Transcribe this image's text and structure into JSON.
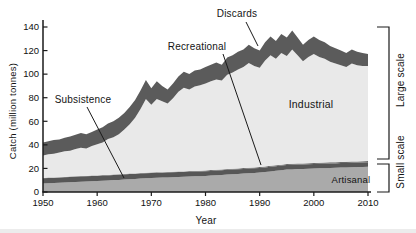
{
  "chart_data": {
    "type": "area",
    "stacked": true,
    "title": "",
    "xlabel": "Year",
    "ylabel": "Catch (million tonnes)",
    "xlim": [
      1950,
      2010
    ],
    "ylim": [
      0,
      140
    ],
    "x_ticks": [
      1950,
      1960,
      1970,
      1980,
      1990,
      2000,
      2010
    ],
    "y_ticks": [
      0,
      20,
      40,
      60,
      80,
      100,
      120,
      140
    ],
    "grid": false,
    "legend_position": "inline-annotations",
    "x": [
      1950,
      1951,
      1952,
      1953,
      1954,
      1955,
      1956,
      1957,
      1958,
      1959,
      1960,
      1961,
      1962,
      1963,
      1964,
      1965,
      1966,
      1967,
      1968,
      1969,
      1970,
      1971,
      1972,
      1973,
      1974,
      1975,
      1976,
      1977,
      1978,
      1979,
      1980,
      1981,
      1982,
      1983,
      1984,
      1985,
      1986,
      1987,
      1988,
      1989,
      1990,
      1991,
      1992,
      1993,
      1994,
      1995,
      1996,
      1997,
      1998,
      1999,
      2000,
      2001,
      2002,
      2003,
      2004,
      2005,
      2006,
      2007,
      2008,
      2009,
      2010
    ],
    "series": [
      {
        "name": "Artisanal",
        "color": "#aaaaaa",
        "values": [
          7.2,
          7.4,
          7.6,
          7.8,
          8.0,
          8.3,
          8.5,
          8.7,
          8.9,
          9.1,
          9.3,
          9.6,
          9.8,
          10.1,
          10.3,
          10.6,
          10.9,
          11.1,
          11.4,
          11.6,
          11.9,
          12.1,
          12.2,
          12.4,
          12.6,
          12.8,
          12.9,
          13.1,
          13.3,
          13.4,
          13.6,
          13.9,
          14.2,
          14.5,
          14.8,
          15.1,
          15.3,
          15.6,
          15.9,
          16.2,
          16.5,
          17.0,
          17.5,
          18.0,
          18.5,
          19.0,
          19.2,
          19.4,
          19.5,
          19.7,
          19.9,
          20.1,
          20.2,
          20.4,
          20.5,
          20.7,
          20.9,
          21.0,
          21.2,
          21.3,
          21.5
        ]
      },
      {
        "name": "Subsistence",
        "color": "#575757",
        "values": [
          4.5,
          4.5,
          4.5,
          4.5,
          4.5,
          4.5,
          4.5,
          4.5,
          4.5,
          4.5,
          4.3,
          4.3,
          4.3,
          4.3,
          4.3,
          4.3,
          4.3,
          4.3,
          4.3,
          4.3,
          4.1,
          4.1,
          4.1,
          4.1,
          4.1,
          4.1,
          4.1,
          4.1,
          4.1,
          4.1,
          4.0,
          4.0,
          4.0,
          4.0,
          4.0,
          4.0,
          4.0,
          4.0,
          4.0,
          4.0,
          3.9,
          3.9,
          3.9,
          3.9,
          3.9,
          3.9,
          3.9,
          3.9,
          3.9,
          3.9,
          3.8,
          3.8,
          3.8,
          3.8,
          3.8,
          3.8,
          3.8,
          3.8,
          3.8,
          3.8,
          3.8
        ]
      },
      {
        "name": "Recreational",
        "color": "#6b6b6b",
        "values": [
          0.3,
          0.3,
          0.3,
          0.3,
          0.3,
          0.3,
          0.3,
          0.3,
          0.3,
          0.3,
          0.4,
          0.4,
          0.4,
          0.4,
          0.4,
          0.4,
          0.4,
          0.4,
          0.4,
          0.4,
          0.5,
          0.5,
          0.5,
          0.5,
          0.5,
          0.5,
          0.5,
          0.5,
          0.5,
          0.5,
          0.7,
          0.7,
          0.7,
          0.7,
          0.7,
          0.7,
          0.7,
          0.7,
          0.7,
          0.7,
          0.8,
          0.8,
          0.8,
          0.8,
          0.8,
          0.8,
          0.8,
          0.8,
          0.8,
          0.8,
          1.0,
          1.0,
          1.0,
          1.0,
          1.0,
          1.0,
          1.0,
          1.0,
          1.0,
          1.0,
          1.0
        ]
      },
      {
        "name": "Industrial",
        "color": "#e9e9e9",
        "values": [
          19.0,
          19.8,
          20.1,
          20.9,
          21.7,
          21.9,
          23.2,
          24.0,
          23.3,
          25.1,
          26.5,
          27.7,
          30.5,
          31.7,
          34.0,
          37.7,
          41.9,
          47.2,
          54.4,
          62.7,
          57.5,
          62.3,
          60.2,
          58.0,
          62.3,
          67.6,
          71.0,
          69.3,
          71.6,
          72.5,
          73.7,
          75.4,
          76.6,
          75.3,
          80.0,
          81.7,
          84.0,
          85.7,
          88.9,
          86.1,
          84.3,
          89.8,
          93.8,
          90.3,
          94.8,
          91.8,
          97.1,
          91.9,
          86.8,
          90.1,
          92.3,
          89.6,
          88.0,
          85.3,
          83.7,
          82.0,
          80.3,
          83.2,
          81.5,
          80.9,
          80.7
        ]
      },
      {
        "name": "Discards",
        "color": "#5b5b5b",
        "values": [
          11,
          11,
          11.5,
          11,
          11.5,
          12,
          12,
          12.5,
          12,
          12,
          12.5,
          13,
          13,
          13.5,
          14,
          14,
          14.5,
          15,
          15.5,
          16,
          14,
          15,
          13,
          12,
          12.5,
          13,
          13.5,
          13,
          13.5,
          13.5,
          14,
          14,
          14.5,
          13.5,
          14.5,
          14.5,
          15,
          15,
          15.5,
          15,
          14.5,
          15.5,
          16,
          15,
          16,
          15.5,
          16,
          15,
          14,
          14.5,
          15,
          14.5,
          14,
          13.5,
          13,
          12.5,
          12,
          12,
          11.5,
          11,
          10
        ]
      }
    ]
  },
  "annotations": {
    "discards": "Discards",
    "recreational": "Recreational",
    "subsistence": "Subsistence",
    "industrial": "Industrial",
    "artisanal": "Artisanal"
  },
  "side_labels": {
    "large_scale": "Large scale",
    "small_scale": "Small scale"
  },
  "axis": {
    "xlabel": "Year",
    "ylabel": "Catch (million tonnes)"
  },
  "colors": {
    "axis": "#1a1a1a",
    "annotation_text": "#141414",
    "background": "#ffffff"
  }
}
